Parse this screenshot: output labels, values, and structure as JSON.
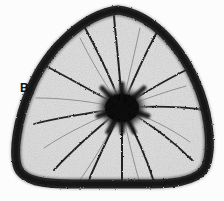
{
  "figure": {
    "panel_label": "B",
    "specimen_type": "rounded-triangular test, oral/apertural view",
    "background_color": "#fcfcfc",
    "outline_color": "#151515",
    "interior_color": "#f2f2f2",
    "stipple_color": "#9a9a9a",
    "septa_color": "#2a2a2a",
    "boss_color": "#101010",
    "canvas": {
      "width": 224,
      "height": 201
    }
  },
  "morphology": {
    "outline_name": "peripheral-margin",
    "apices": [
      {
        "name": "apex-top",
        "x": 118,
        "y": 10
      },
      {
        "name": "apex-lower-left",
        "x": 22,
        "y": 176
      },
      {
        "name": "apex-lower-right",
        "x": 206,
        "y": 174
      }
    ],
    "umbilical_boss": {
      "name": "central-boss",
      "cx": 122,
      "cy": 108,
      "rx": 22,
      "ry": 19
    },
    "septa_count": 12,
    "septa": [
      {
        "index": 1,
        "angle_deg": 268,
        "length": 98,
        "curve": 26
      },
      {
        "index": 2,
        "angle_deg": 300,
        "length": 96,
        "curve": 24
      },
      {
        "index": 3,
        "angle_deg": 330,
        "length": 86,
        "curve": 20
      },
      {
        "index": 4,
        "angle_deg": 357,
        "length": 82,
        "curve": 18
      },
      {
        "index": 5,
        "angle_deg": 24,
        "length": 80,
        "curve": 22
      },
      {
        "index": 6,
        "angle_deg": 52,
        "length": 84,
        "curve": 24
      },
      {
        "index": 7,
        "angle_deg": 80,
        "length": 78,
        "curve": 22
      },
      {
        "index": 8,
        "angle_deg": 108,
        "length": 82,
        "curve": 20
      },
      {
        "index": 9,
        "angle_deg": 138,
        "length": 86,
        "curve": 22
      },
      {
        "index": 10,
        "angle_deg": 168,
        "length": 88,
        "curve": 20
      },
      {
        "index": 11,
        "angle_deg": 200,
        "length": 92,
        "curve": 22
      },
      {
        "index": 12,
        "angle_deg": 235,
        "length": 96,
        "curve": 26
      }
    ]
  }
}
